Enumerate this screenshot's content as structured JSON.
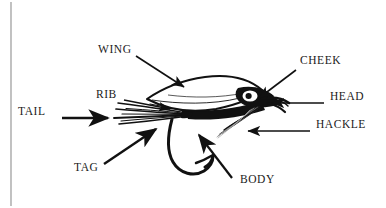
{
  "figure": {
    "kind": "labeled-diagram",
    "background_color": "#ffffff",
    "ink_color": "#111111",
    "text_color": "#1a1a1a",
    "left_rule": {
      "name": "left-margin-rule",
      "color": "#8a8a8a"
    }
  },
  "labels": {
    "tail": "TAIL",
    "rib": "RIB",
    "wing": "WING",
    "tag": "TAG",
    "cheek": "CHEEK",
    "head": "HEAD",
    "hackle": "HACKLE",
    "body": "BODY"
  },
  "parts": [
    {
      "id": "tail",
      "label": "TAIL",
      "label_x": 18,
      "label_y": 112,
      "arrow_from": [
        62,
        118
      ],
      "arrow_to": [
        112,
        118
      ],
      "arrow_style": "thick"
    },
    {
      "id": "rib",
      "label": "RIB",
      "label_x": 96,
      "label_y": 95,
      "arrow_from": [
        124,
        101
      ],
      "arrow_to": [
        172,
        110
      ],
      "arrow_style": "thin"
    },
    {
      "id": "wing",
      "label": "WING",
      "label_x": 98,
      "label_y": 50,
      "arrow_from": [
        136,
        56
      ],
      "arrow_to": [
        186,
        88
      ],
      "arrow_style": "thin"
    },
    {
      "id": "tag",
      "label": "TAG",
      "label_x": 74,
      "label_y": 168,
      "arrow_from": [
        104,
        164
      ],
      "arrow_to": [
        158,
        128
      ],
      "arrow_style": "thick"
    },
    {
      "id": "cheek",
      "label": "CHEEK",
      "label_x": 300,
      "label_y": 60,
      "arrow_from": [
        296,
        70
      ],
      "arrow_to": [
        256,
        100
      ],
      "arrow_style": "thin"
    },
    {
      "id": "head",
      "label": "HEAD",
      "label_x": 330,
      "label_y": 97,
      "arrow_from": [
        324,
        103
      ],
      "arrow_to": [
        268,
        103
      ],
      "arrow_style": "thin"
    },
    {
      "id": "hackle",
      "label": "HACKLE",
      "label_x": 316,
      "label_y": 125,
      "arrow_from": [
        310,
        131
      ],
      "arrow_to": [
        244,
        131
      ],
      "arrow_style": "thin"
    },
    {
      "id": "body",
      "label": "BODY",
      "label_x": 240,
      "label_y": 180,
      "arrow_from": [
        232,
        178
      ],
      "arrow_to": [
        196,
        132
      ],
      "arrow_style": "thick"
    }
  ]
}
